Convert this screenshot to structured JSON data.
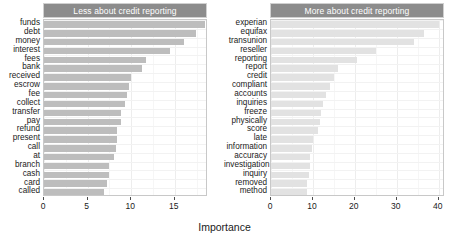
{
  "chart_data": {
    "type": "bar",
    "title": "",
    "xlabel": "Importance",
    "ylabel": "",
    "orientation": "horizontal",
    "grid": true,
    "legend_position": "none",
    "panels": [
      {
        "name": "less-about-credit-reporting",
        "title": "Less about credit reporting",
        "xlim": [
          0,
          18.8
        ],
        "xticks": [
          0,
          5,
          10,
          15
        ],
        "xtick_labels": [
          "0",
          "5",
          "10",
          "15"
        ],
        "bar_color": "#bdbdbd",
        "categories": [
          "funds",
          "debt",
          "money",
          "interest",
          "fees",
          "bank",
          "received",
          "escrow",
          "fee",
          "collect",
          "transfer",
          "pay",
          "refund",
          "present",
          "call",
          "at",
          "branch",
          "cash",
          "card",
          "called"
        ],
        "values": [
          18.5,
          17.4,
          16.0,
          14.4,
          11.7,
          11.2,
          10.0,
          9.8,
          9.5,
          9.3,
          8.8,
          8.8,
          8.4,
          8.4,
          8.3,
          8.0,
          7.4,
          7.4,
          7.2,
          6.9
        ]
      },
      {
        "name": "more-about-credit-reporting",
        "title": "More about credit reporting",
        "xlim": [
          0,
          41.5
        ],
        "xticks": [
          0,
          10,
          20,
          30,
          40
        ],
        "xtick_labels": [
          "0",
          "10",
          "20",
          "30",
          "40"
        ],
        "bar_color": "#e2e2e2",
        "categories": [
          "experian",
          "equifax",
          "transunion",
          "reseller",
          "reporting",
          "report",
          "credit",
          "compliant",
          "accounts",
          "inquiries",
          "freeze",
          "physically",
          "score",
          "late",
          "information",
          "accuracy",
          "investigation",
          "inquiry",
          "removed",
          "method"
        ],
        "values": [
          40.0,
          36.5,
          34.0,
          25.0,
          20.5,
          16.0,
          15.0,
          14.0,
          13.0,
          12.4,
          12.0,
          11.8,
          11.3,
          10.0,
          9.8,
          9.3,
          9.2,
          9.0,
          8.7,
          8.5
        ]
      }
    ]
  },
  "colors": {
    "strip_background": "#8c8c8c",
    "strip_text": "#ffffff",
    "bar_left": "#bdbdbd",
    "bar_right": "#e2e2e2",
    "grid": "#ededed",
    "text": "#1a1a1a"
  }
}
